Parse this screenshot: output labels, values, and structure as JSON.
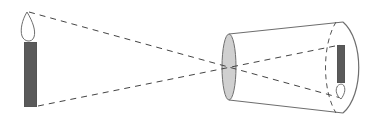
{
  "diagram": {
    "elements": [
      {
        "id": "object-candle",
        "label": "candle (object)",
        "orientation": "upright"
      },
      {
        "id": "light-rays",
        "label": "dashed light rays crossing at pinhole"
      },
      {
        "id": "pinhole",
        "label": "pinhole / aperture disk"
      },
      {
        "id": "camera-body",
        "label": "truncated cone camera body"
      },
      {
        "id": "screen",
        "label": "dashed image screen"
      },
      {
        "id": "image-candle",
        "label": "candle image",
        "orientation": "inverted"
      }
    ],
    "colors": {
      "stroke": "#6e6e6e",
      "candle_fill": "#5a5a5a",
      "pinhole_fill": "#d0d0d0",
      "dash": "#444444",
      "background": "#ffffff"
    }
  }
}
